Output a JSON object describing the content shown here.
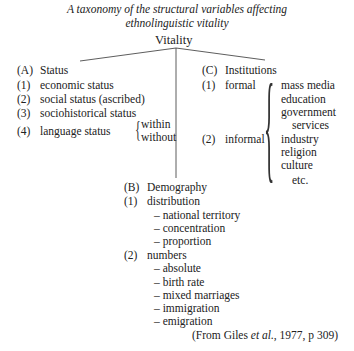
{
  "title_line1": "A taxonomy of the structural variables affecting",
  "title_line2": "ethnolinguistic vitality",
  "root": "Vitality",
  "status": {
    "heading_marker": "(A)",
    "heading": "Status",
    "items": [
      {
        "marker": "(1)",
        "label": "economic status"
      },
      {
        "marker": "(2)",
        "label": "social status (ascribed)"
      },
      {
        "marker": "(3)",
        "label": "sociohistorical status"
      },
      {
        "marker": "(4)",
        "label": "language status"
      }
    ],
    "language_status_sub": [
      "within",
      "without"
    ]
  },
  "institutions": {
    "heading_marker": "(C)",
    "heading": "Institutions",
    "items": [
      {
        "marker": "(1)",
        "label": "formal"
      },
      {
        "marker": "(2)",
        "label": "informal"
      }
    ],
    "examples": [
      "mass media",
      "education",
      "government",
      "services",
      "industry",
      "religion",
      "culture",
      "etc."
    ]
  },
  "demography": {
    "heading_marker": "(B)",
    "heading": "Demography",
    "groups": [
      {
        "marker": "(1)",
        "label": "distribution",
        "subitems": [
          "– national territory",
          "– concentration",
          "– proportion"
        ]
      },
      {
        "marker": "(2)",
        "label": "numbers",
        "subitems": [
          "– absolute",
          "– birth rate",
          "– mixed marriages",
          "– immigration",
          "– emigration"
        ]
      }
    ]
  },
  "citation": {
    "prefix": "(From Giles ",
    "etal": "et al.",
    "suffix": ", 1977, p 309)"
  }
}
